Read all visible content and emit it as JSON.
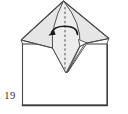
{
  "diagram": {
    "step_number": "19",
    "colors": {
      "paper_shaded": "#e6e6e6",
      "paper_light": "#ededed",
      "paper_white": "#ffffff",
      "outline": "#4a4a4a",
      "arrow": "#1a1a1a"
    },
    "fold": {
      "fold_line_style": "dashed-valley-fold",
      "arrow_direction": "curved-left"
    }
  }
}
